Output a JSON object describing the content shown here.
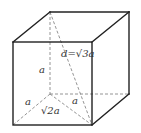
{
  "diagram": {
    "type": "cube-space-diagonal",
    "labels": {
      "space_diagonal": "d=√3a",
      "vertical_edge": "a",
      "left_bottom_edge": "a",
      "back_bottom_edge": "a",
      "bottom_face_diagonal": "√2a"
    },
    "colors": {
      "edge": "#222222",
      "hidden_edge": "#888888",
      "label": "#333333"
    }
  }
}
